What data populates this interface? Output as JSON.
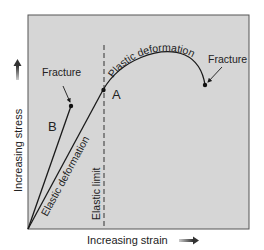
{
  "diagram": {
    "colors": {
      "background": "#ffffff",
      "plot_fill": "#d6d6d6",
      "plot_border": "#555555",
      "line": "#1a1a1a",
      "text": "#222222",
      "dashed": "#333333"
    },
    "axes": {
      "x_label": "Increasing strain",
      "y_label": "Increasing stress"
    },
    "labels": {
      "fracture_b": "Fracture",
      "fracture_a": "Fracture",
      "point_a": "A",
      "point_b": "B",
      "elastic_deformation": "Elastic deformation",
      "elastic_limit": "Elastic limit",
      "plastic_deformation": "Plastic deformation"
    },
    "curves": [
      {
        "name": "B",
        "description": "Brittle material: linear elastic until fracture",
        "path": [
          [
            28,
            229
          ],
          [
            71,
            106
          ]
        ],
        "fracture_point": [
          71,
          106
        ]
      },
      {
        "name": "A",
        "description": "Ductile material: elastic to elastic limit, then plastic deformation until fracture",
        "elastic_path": [
          [
            28,
            229
          ],
          [
            103,
            90
          ]
        ],
        "elastic_limit_point": [
          103,
          90
        ],
        "plastic_end": [
          205,
          85
        ],
        "fracture_point": [
          205,
          85
        ]
      }
    ]
  }
}
